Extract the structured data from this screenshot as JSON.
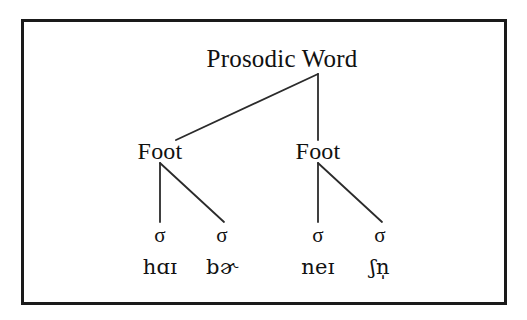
{
  "figure": {
    "kind": "prosodic-tree-diagram",
    "background_color": "#ffffff",
    "border_color": "#1a1a1a",
    "line_color": "#2b2b2b",
    "text_color": "#111111"
  },
  "tree": {
    "root": {
      "label": "Prosodic Word",
      "x": 282,
      "y": 58
    },
    "junction": {
      "x": 318,
      "y": 74
    },
    "feet": [
      {
        "label": "Foot",
        "x": 160,
        "y": 151
      },
      {
        "label": "Foot",
        "x": 318,
        "y": 151
      }
    ],
    "syllables": [
      {
        "sigma": "σ",
        "segment": "hɑɪ",
        "x": 160,
        "sigma_y": 235,
        "segment_y": 267
      },
      {
        "sigma": "σ",
        "segment": "bɚ",
        "x": 222,
        "sigma_y": 235,
        "segment_y": 267
      },
      {
        "sigma": "σ",
        "segment": "neɪ",
        "x": 318,
        "sigma_y": 235,
        "segment_y": 267
      },
      {
        "sigma": "σ",
        "segment": "ʃn̩",
        "x": 380,
        "sigma_y": 235,
        "segment_y": 267
      }
    ],
    "branches": [
      {
        "name": "word-to-left-foot",
        "x1": 318,
        "y1": 74,
        "x2": 176,
        "y2": 140
      },
      {
        "name": "word-to-right-foot",
        "x1": 318,
        "y1": 74,
        "x2": 318,
        "y2": 140
      },
      {
        "name": "left-foot-to-sigma-1",
        "x1": 160,
        "y1": 163,
        "x2": 160,
        "y2": 222
      },
      {
        "name": "left-foot-to-sigma-2",
        "x1": 160,
        "y1": 163,
        "x2": 224,
        "y2": 222
      },
      {
        "name": "right-foot-to-sigma-3",
        "x1": 318,
        "y1": 163,
        "x2": 318,
        "y2": 222
      },
      {
        "name": "right-foot-to-sigma-4",
        "x1": 318,
        "y1": 163,
        "x2": 382,
        "y2": 222
      }
    ]
  },
  "chart_data": {
    "type": "tree",
    "title": "Prosodic Word",
    "levels": [
      "Prosodic Word",
      "Foot",
      "σ",
      "segments"
    ],
    "nodes": [
      {
        "id": "pword",
        "label": "Prosodic Word",
        "level": 0,
        "parent": null
      },
      {
        "id": "foot1",
        "label": "Foot",
        "level": 1,
        "parent": "pword"
      },
      {
        "id": "foot2",
        "label": "Foot",
        "level": 1,
        "parent": "pword"
      },
      {
        "id": "syl1",
        "label": "σ",
        "level": 2,
        "parent": "foot1",
        "segment": "hɑɪ"
      },
      {
        "id": "syl2",
        "label": "σ",
        "level": 2,
        "parent": "foot1",
        "segment": "bɚ"
      },
      {
        "id": "syl3",
        "label": "σ",
        "level": 2,
        "parent": "foot2",
        "segment": "neɪ"
      },
      {
        "id": "syl4",
        "label": "σ",
        "level": 2,
        "parent": "foot2",
        "segment": "ʃn̩"
      }
    ],
    "edges": [
      [
        "pword",
        "foot1"
      ],
      [
        "pword",
        "foot2"
      ],
      [
        "foot1",
        "syl1"
      ],
      [
        "foot1",
        "syl2"
      ],
      [
        "foot2",
        "syl3"
      ],
      [
        "foot2",
        "syl4"
      ]
    ]
  }
}
